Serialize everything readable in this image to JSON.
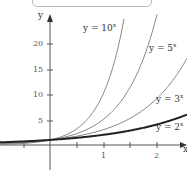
{
  "chart_data": {
    "type": "line",
    "title": "",
    "xlabel": "x",
    "ylabel": "y",
    "xlim": [
      -0.95,
      2.6
    ],
    "ylim": [
      -3,
      25
    ],
    "x_ticks": [
      -1,
      -0.5,
      0,
      0.5,
      1,
      1.5,
      2
    ],
    "x_tick_labels": [
      "1",
      "2"
    ],
    "y_ticks": [
      5,
      10,
      15,
      20
    ],
    "y_tick_labels": [
      "5",
      "10",
      "15",
      "20"
    ],
    "grid": false,
    "series": [
      {
        "name": "y = 10^x",
        "label": "y = 10",
        "exp": "x",
        "base": 10,
        "color": "#888888",
        "width": 1
      },
      {
        "name": "y = 5^x",
        "label": "y = 5",
        "exp": "x",
        "base": 5,
        "color": "#888888",
        "width": 1
      },
      {
        "name": "y = 3^x",
        "label": "y = 3",
        "exp": "x",
        "base": 3,
        "color": "#888888",
        "width": 1
      },
      {
        "name": "y = 2^x",
        "label": "y = 2",
        "exp": "x",
        "base": 2,
        "color": "#222222",
        "width": 2
      }
    ]
  },
  "axes": {
    "x_label": "x",
    "y_label": "y"
  },
  "ticks": {
    "x1": "1",
    "x2": "2",
    "y5": "5",
    "y10": "10",
    "y15": "15",
    "y20": "20"
  },
  "labels": {
    "s10": "y = 10",
    "s10_exp": "x",
    "s5": "y = 5",
    "s5_exp": "x",
    "s3": "y = 3",
    "s3_exp": "x",
    "s2": "y = 2",
    "s2_exp": "x"
  }
}
